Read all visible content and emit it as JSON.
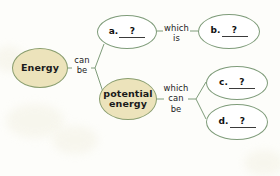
{
  "diagram": {
    "type": "concept-map",
    "colors": {
      "filled_node_fill": "#ece3bb",
      "filled_node_stroke": "#8a9e6f",
      "blank_node_fill": "#ffffff",
      "blank_node_stroke": "#7f9c7a",
      "line": "#7f9c7a",
      "text": "#1a1a1a",
      "background": "#fdfdfa"
    },
    "nodes": [
      {
        "id": "energy",
        "label": "Energy",
        "kind": "filled"
      },
      {
        "id": "a",
        "letter": "a.",
        "value": "?",
        "kind": "blank"
      },
      {
        "id": "b",
        "letter": "b.",
        "value": "?",
        "kind": "blank"
      },
      {
        "id": "potential",
        "label": "potential\nenergy",
        "kind": "filled"
      },
      {
        "id": "c",
        "letter": "c.",
        "value": "?",
        "kind": "blank"
      },
      {
        "id": "d",
        "letter": "d.",
        "value": "?",
        "kind": "blank"
      }
    ],
    "connectors": [
      {
        "id": "can-be",
        "label": "can\nbe",
        "from": "energy",
        "to": [
          "a",
          "potential"
        ]
      },
      {
        "id": "which-is",
        "label": "which\nis",
        "from": "a",
        "to": [
          "b"
        ]
      },
      {
        "id": "which-can-be",
        "label": "which\ncan\nbe",
        "from": "potential",
        "to": [
          "c",
          "d"
        ]
      }
    ]
  }
}
